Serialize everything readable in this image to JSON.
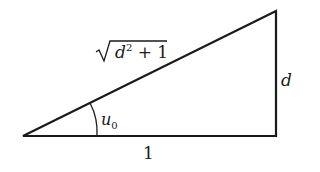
{
  "diagram": {
    "type": "right-triangle",
    "labels": {
      "hypotenuse_base": "d",
      "hypotenuse_exp": "2",
      "hypotenuse_rest": " + 1",
      "vertical_side": "d",
      "horizontal_side": "1",
      "angle_var": "u",
      "angle_sub": "0"
    },
    "colors": {
      "stroke": "#1a1a1a",
      "background": "#ffffff"
    }
  }
}
